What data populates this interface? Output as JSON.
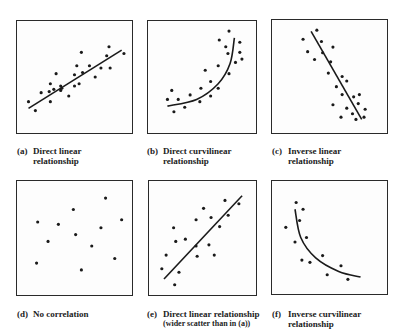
{
  "figure": {
    "panels": [
      {
        "id": "a",
        "tag": "(a)",
        "caption_lines": [
          "Direct linear",
          "relationship"
        ],
        "frame": {
          "left": 16,
          "top": 20,
          "width": 117,
          "height": 114
        },
        "caption_pos": {
          "left": 17,
          "top": 146
        },
        "fit": {
          "type": "line",
          "points": [
            [
              10,
              78
            ],
            [
              91,
              26
            ]
          ]
        },
        "dots": [
          [
            10,
            72
          ],
          [
            16,
            80
          ],
          [
            21,
            64
          ],
          [
            29,
            56
          ],
          [
            28,
            63
          ],
          [
            29,
            72
          ],
          [
            32,
            61
          ],
          [
            34,
            47
          ],
          [
            38,
            58
          ],
          [
            38,
            62
          ],
          [
            39,
            60
          ],
          [
            45,
            67
          ],
          [
            50,
            58
          ],
          [
            50,
            48
          ],
          [
            52,
            40
          ],
          [
            54,
            56
          ],
          [
            56,
            28
          ],
          [
            57,
            46
          ],
          [
            63,
            40
          ],
          [
            68,
            50
          ],
          [
            73,
            42
          ],
          [
            78,
            31
          ],
          [
            80,
            23
          ],
          [
            81,
            42
          ],
          [
            93,
            29
          ]
        ]
      },
      {
        "id": "b",
        "tag": "(b)",
        "caption_lines": [
          "Direct curvilinear",
          "relationship"
        ],
        "frame": {
          "left": 147,
          "top": 20,
          "width": 110,
          "height": 114
        },
        "caption_pos": {
          "left": 147,
          "top": 146
        },
        "fit": {
          "type": "curve",
          "points": [
            [
              18,
              76
            ],
            [
              45,
              70
            ],
            [
              65,
              56
            ],
            [
              76,
              38
            ],
            [
              80,
              15
            ]
          ]
        },
        "dots": [
          [
            18,
            70
          ],
          [
            22,
            62
          ],
          [
            24,
            81
          ],
          [
            28,
            70
          ],
          [
            34,
            77
          ],
          [
            39,
            66
          ],
          [
            48,
            72
          ],
          [
            49,
            60
          ],
          [
            53,
            44
          ],
          [
            58,
            54
          ],
          [
            58,
            67
          ],
          [
            65,
            60
          ],
          [
            65,
            40
          ],
          [
            66,
            17
          ],
          [
            72,
            23
          ],
          [
            74,
            29
          ],
          [
            75,
            9
          ],
          [
            75,
            47
          ],
          [
            81,
            37
          ],
          [
            85,
            19
          ],
          [
            85,
            28
          ],
          [
            87,
            34
          ]
        ]
      },
      {
        "id": "c",
        "tag": "(c)",
        "caption_lines": [
          "Inverse linear",
          "relationship"
        ],
        "frame": {
          "left": 271,
          "top": 19,
          "width": 117,
          "height": 115
        },
        "caption_pos": {
          "left": 272,
          "top": 146
        },
        "fit": {
          "type": "line",
          "points": [
            [
              34,
              10
            ],
            [
              78,
              88
            ]
          ]
        },
        "dots": [
          [
            27,
            17
          ],
          [
            31,
            28
          ],
          [
            37,
            35
          ],
          [
            39,
            9
          ],
          [
            43,
            19
          ],
          [
            44,
            29
          ],
          [
            51,
            37
          ],
          [
            53,
            24
          ],
          [
            49,
            47
          ],
          [
            56,
            59
          ],
          [
            61,
            50
          ],
          [
            65,
            54
          ],
          [
            61,
            66
          ],
          [
            53,
            75
          ],
          [
            65,
            78
          ],
          [
            71,
            68
          ],
          [
            76,
            66
          ],
          [
            75,
            74
          ],
          [
            70,
            83
          ],
          [
            81,
            79
          ],
          [
            80,
            86
          ],
          [
            73,
            88
          ],
          [
            60,
            86
          ]
        ]
      },
      {
        "id": "d",
        "tag": "(d)",
        "caption_lines": [
          "No correlation"
        ],
        "frame": {
          "left": 16,
          "top": 180,
          "width": 117,
          "height": 116
        },
        "caption_pos": {
          "left": 17,
          "top": 309
        },
        "fit": null,
        "dots": [
          [
            18,
            36
          ],
          [
            36,
            38
          ],
          [
            49,
            25
          ],
          [
            77,
            15
          ],
          [
            91,
            34
          ],
          [
            73,
            41
          ],
          [
            51,
            47
          ],
          [
            27,
            53
          ],
          [
            65,
            57
          ],
          [
            17,
            72
          ],
          [
            85,
            68
          ],
          [
            56,
            78
          ]
        ]
      },
      {
        "id": "e",
        "tag": "(e)",
        "caption_lines": [
          "Direct linear relationship",
          "(wider scatter than in (a))"
        ],
        "frame": {
          "left": 148,
          "top": 180,
          "width": 109,
          "height": 116
        },
        "caption_pos": {
          "left": 147,
          "top": 309
        },
        "fit": {
          "type": "line",
          "points": [
            [
              14,
              86
            ],
            [
              87,
              13
            ]
          ]
        },
        "dots": [
          [
            12,
            77
          ],
          [
            16,
            65
          ],
          [
            23,
            41
          ],
          [
            25,
            53
          ],
          [
            34,
            51
          ],
          [
            24,
            91
          ],
          [
            28,
            80
          ],
          [
            44,
            57
          ],
          [
            44,
            34
          ],
          [
            45,
            66
          ],
          [
            51,
            24
          ],
          [
            56,
            56
          ],
          [
            58,
            32
          ],
          [
            61,
            65
          ],
          [
            66,
            40
          ],
          [
            71,
            17
          ],
          [
            74,
            30
          ],
          [
            84,
            20
          ]
        ]
      },
      {
        "id": "f",
        "tag": "(f)",
        "caption_lines": [
          "Inverse curvilinear",
          "relationship"
        ],
        "frame": {
          "left": 271,
          "top": 180,
          "width": 117,
          "height": 115
        },
        "caption_pos": {
          "left": 272,
          "top": 309
        },
        "fit": {
          "type": "curve",
          "points": [
            [
              20,
              25
            ],
            [
              25,
              50
            ],
            [
              38,
              68
            ],
            [
              58,
              80
            ],
            [
              77,
              85
            ]
          ]
        },
        "dots": [
          [
            21,
            19
          ],
          [
            27,
            25
          ],
          [
            24,
            35
          ],
          [
            12,
            41
          ],
          [
            20,
            54
          ],
          [
            30,
            50
          ],
          [
            26,
            70
          ],
          [
            33,
            72
          ],
          [
            44,
            66
          ],
          [
            60,
            75
          ],
          [
            48,
            83
          ],
          [
            66,
            87
          ]
        ]
      }
    ],
    "colors": {
      "ink": "#1a1a1a",
      "frame": "#2a2a2a",
      "background": "#ffffff"
    }
  }
}
